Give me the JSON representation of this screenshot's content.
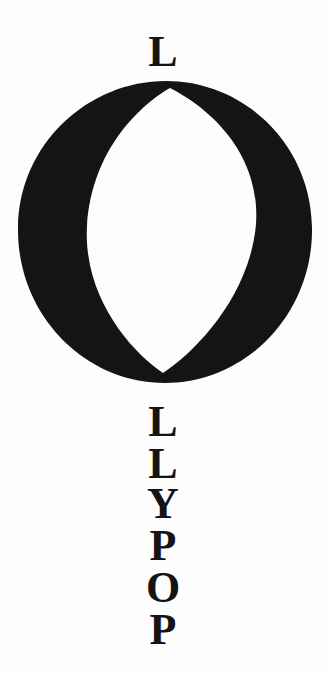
{
  "artwork": {
    "title": "Lollypop",
    "word": "LOLLYPOP",
    "background_color": "#fdfdfd",
    "ink_color": "#141414",
    "top_letter": "L",
    "center_glyph": {
      "letter": "O",
      "name": "big-o-glyph",
      "style": "bold serif capital O with narrow pointed oval counter",
      "outer_ellipse": {
        "cx": 165,
        "cy": 152,
        "rx": 145,
        "ry": 152
      },
      "inner_counter": {
        "cx": 170,
        "cy": 148,
        "rx": 88,
        "ry": 143,
        "shape": "vesica"
      }
    },
    "stacked_letters": [
      "L",
      "L",
      "Y",
      "P",
      "O",
      "P"
    ]
  }
}
